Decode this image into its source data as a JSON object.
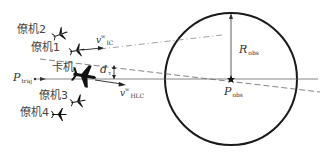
{
  "labels": {
    "wing2": "僚机2",
    "wing1": "僚机1",
    "lead": "卡机",
    "wing3": "僚机3",
    "wing4": "僚机4",
    "p_traj_main": "P",
    "p_traj_sub": "traj",
    "d_main": "d",
    "d_sub": "τ",
    "v_upper_main": "v",
    "v_upper_sup": "w",
    "v_upper_sub": "IC",
    "v_lower_main": "v",
    "v_lower_sup": "w",
    "v_lower_sub": "HLC",
    "r_obs_main": "R",
    "r_obs_sub": "obs",
    "p_obs_main": "P",
    "p_obs_sub": "obs"
  },
  "colors": {
    "stroke": "#1a1a1a",
    "line": "#555555",
    "text": "#333333"
  },
  "geometry": {
    "circle_center": [
      231,
      79
    ],
    "circle_radius": 66
  }
}
